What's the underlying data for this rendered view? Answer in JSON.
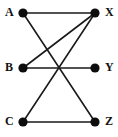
{
  "figure": {
    "name": "bipartite-graph",
    "width": 118,
    "height": 137,
    "background": "#ffffff"
  },
  "style": {
    "edge_color": "#1a1a1a",
    "edge_width": 1.6,
    "vertex_color": "#0d0d0d",
    "vertex_radius": 4.6,
    "label_color": "#121212",
    "label_size": 12
  },
  "graph": {
    "type": "undirected-graph",
    "left_column_x": 23,
    "right_column_x": 95,
    "vertices": [
      {
        "id": "A",
        "label": "A",
        "x": 23,
        "y": 13,
        "label_x": 5,
        "label_y": 6,
        "side": "left"
      },
      {
        "id": "X",
        "label": "X",
        "x": 95,
        "y": 13,
        "label_x": 105,
        "label_y": 6,
        "side": "right"
      },
      {
        "id": "B",
        "label": "B",
        "x": 23,
        "y": 68,
        "label_x": 5,
        "label_y": 61,
        "side": "left"
      },
      {
        "id": "Y",
        "label": "Y",
        "x": 95,
        "y": 68,
        "label_x": 105,
        "label_y": 61,
        "side": "right"
      },
      {
        "id": "C",
        "label": "C",
        "x": 23,
        "y": 122,
        "label_x": 5,
        "label_y": 115,
        "side": "left"
      },
      {
        "id": "Z",
        "label": "Z",
        "x": 95,
        "y": 122,
        "label_x": 105,
        "label_y": 115,
        "side": "right"
      }
    ],
    "edges": [
      {
        "id": "A-X",
        "from": "A",
        "to": "X",
        "x1": 23,
        "y1": 13,
        "x2": 95,
        "y2": 13
      },
      {
        "id": "A-Z",
        "from": "A",
        "to": "Z",
        "x1": 23,
        "y1": 13,
        "x2": 95,
        "y2": 122
      },
      {
        "id": "B-X",
        "from": "B",
        "to": "X",
        "x1": 23,
        "y1": 68,
        "x2": 95,
        "y2": 13
      },
      {
        "id": "B-Y",
        "from": "B",
        "to": "Y",
        "x1": 23,
        "y1": 68,
        "x2": 95,
        "y2": 68
      },
      {
        "id": "C-X",
        "from": "C",
        "to": "X",
        "x1": 23,
        "y1": 122,
        "x2": 95,
        "y2": 13
      },
      {
        "id": "C-Z",
        "from": "C",
        "to": "Z",
        "x1": 23,
        "y1": 122,
        "x2": 95,
        "y2": 122
      }
    ],
    "degrees": {
      "A": 2,
      "B": 2,
      "C": 2,
      "X": 3,
      "Y": 1,
      "Z": 2
    }
  }
}
